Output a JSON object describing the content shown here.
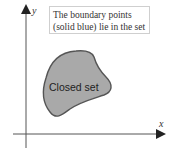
{
  "axes": {
    "x_label": "x",
    "y_label": "y"
  },
  "note": {
    "line1": "The boundary points",
    "line2": "(solid blue) lie in the set"
  },
  "shape": {
    "label": "Closed set",
    "fill": "#a9a9a9",
    "stroke": "#555555"
  }
}
